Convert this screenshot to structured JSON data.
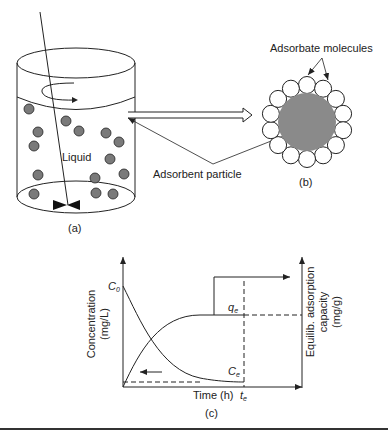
{
  "panel_a": {
    "caption": "(a)",
    "liquid_label": "Liquid",
    "particle_color": "#7a7a7a",
    "particles": [
      [
        29,
        109
      ],
      [
        66,
        121
      ],
      [
        79,
        131
      ],
      [
        38,
        132
      ],
      [
        106,
        133
      ],
      [
        34,
        146
      ],
      [
        119,
        142
      ],
      [
        110,
        159
      ],
      [
        38,
        175
      ],
      [
        95,
        178
      ],
      [
        124,
        174
      ],
      [
        34,
        194
      ],
      [
        96,
        193
      ],
      [
        113,
        194
      ]
    ]
  },
  "panel_b": {
    "caption": "(b)",
    "adsorbate_label": "Adsorbate molecules",
    "adsorbent_label": "Adsorbent particle",
    "adsorbent_color": "#8a8a8a",
    "molecule_count": 14
  },
  "panel_c": {
    "caption": "(c)",
    "left_axis_label_line1": "Concentration",
    "left_axis_label_line2": "(mg/L)",
    "right_axis_label_line1": "Equilib. adsorption",
    "right_axis_label_line2": "capacity",
    "right_axis_label_line3": "(mg/g)",
    "x_axis_label": "Time (h)",
    "c0_main": "C",
    "c0_sub": "0",
    "qe_main": "q",
    "qe_sub": "e",
    "ce_main": "C",
    "ce_sub": "e",
    "te_main": "t",
    "te_sub": "e"
  },
  "chart_data": {
    "type": "line",
    "title": "",
    "xlabel": "Time (h)",
    "ylabel": "Concentration (mg/L)",
    "y2label": "Equilib. adsorption capacity (mg/g)",
    "annotations": [
      "C0",
      "qe",
      "Ce",
      "te"
    ],
    "series": [
      {
        "name": "Concentration (C)",
        "axis": "left",
        "shape": "decaying from C0 to Ce",
        "x": [
          0,
          0.2,
          0.4,
          0.6,
          0.8,
          1.0
        ],
        "values": [
          1.0,
          0.45,
          0.15,
          0.05,
          0.02,
          0.02
        ]
      },
      {
        "name": "Adsorption capacity (q)",
        "axis": "right",
        "shape": "rising from 0 to qe",
        "x": [
          0,
          0.2,
          0.4,
          0.6,
          0.8,
          1.0
        ],
        "values": [
          0,
          0.55,
          0.75,
          0.8,
          0.8,
          0.8
        ]
      }
    ],
    "grid": false,
    "legend": "none"
  }
}
